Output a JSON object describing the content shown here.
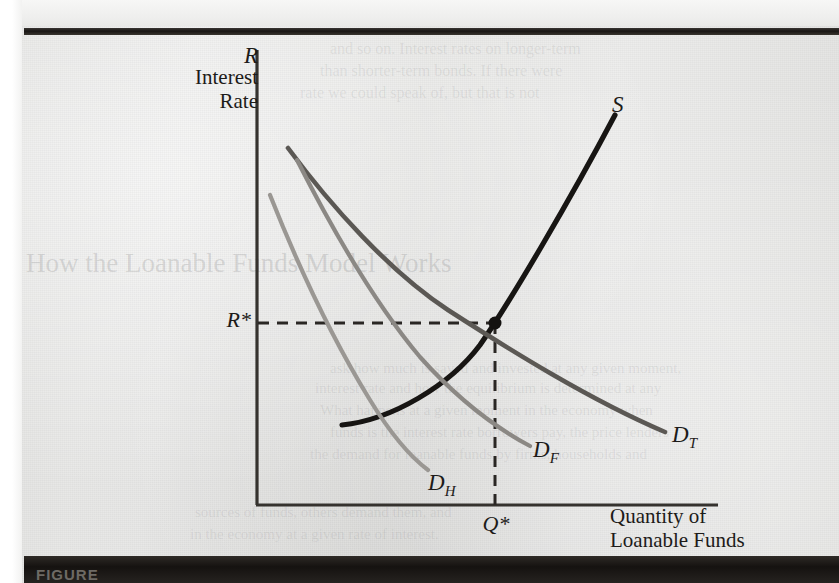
{
  "page": {
    "background_color": "#e8e8e6",
    "caption_prefix": "FIGURE",
    "bleed_through_lines": [
      {
        "text": "the nominal rate — so is very unlikely",
        "x": 95,
        "y": 2,
        "size": 17,
        "class": "ghost"
      },
      {
        "text": "loanable funds have different maturities",
        "x": 24,
        "y": 2,
        "size": 17,
        "class": "ghost faint"
      },
      {
        "text": "and so on. Interest rates on longer-term",
        "x": 330,
        "y": 40,
        "size": 16,
        "class": "ghost faintest"
      },
      {
        "text": "than shorter-term bonds. If there were",
        "x": 320,
        "y": 62,
        "size": 16,
        "class": "ghost faintest"
      },
      {
        "text": "rate we could speak of, but that is not",
        "x": 300,
        "y": 84,
        "size": 16,
        "class": "ghost faintest"
      },
      {
        "text": "How the Loanable Funds Model Works",
        "x": 26,
        "y": 248,
        "size": 27,
        "class": "ghost faint"
      },
      {
        "text": "ask how much is saved and invested at any given moment,",
        "x": 330,
        "y": 360,
        "size": 15,
        "class": "ghost faintest"
      },
      {
        "text": "interest rate and how the equilibrium is determined at any",
        "x": 315,
        "y": 380,
        "size": 15,
        "class": "ghost faintest"
      },
      {
        "text": "What happens at a given moment in the economy when",
        "x": 320,
        "y": 402,
        "size": 15,
        "class": "ghost faintest"
      },
      {
        "text": "funds is the interest rate borrowers pay, the price lenders",
        "x": 330,
        "y": 424,
        "size": 15,
        "class": "ghost faintest"
      },
      {
        "text": "the demand for loanable funds by firms, households and",
        "x": 310,
        "y": 446,
        "size": 15,
        "class": "ghost faintest"
      },
      {
        "text": "sources of funds, others demand them, and",
        "x": 195,
        "y": 504,
        "size": 15,
        "class": "ghost faintest"
      },
      {
        "text": "in the economy at a given rate of interest.",
        "x": 190,
        "y": 526,
        "size": 15,
        "class": "ghost faintest"
      }
    ]
  },
  "chart_data": {
    "type": "line",
    "xlabel": "Quantity of Loanable Funds",
    "ylabel": "Interest Rate",
    "ylabel_symbol": "R",
    "grid": false,
    "legend": "inline-curve-labels",
    "axis": {
      "origin_x": 257,
      "origin_y": 505,
      "x_end": 718,
      "y_top": 50,
      "color": "#35322e"
    },
    "equilibrium": {
      "x": 495,
      "y": 323,
      "price_label": "R*",
      "quantity_label": "Q*",
      "dot_color": "#141210"
    },
    "series": [
      {
        "name": "S",
        "label": "S",
        "role": "supply",
        "color": "#171513",
        "width": 5.2,
        "path": "M 342 425 C 392 420, 450 385, 480 345 C 510 302, 570 200, 615 115",
        "description": "Upward sloping supply of loanable funds"
      },
      {
        "name": "D_T",
        "label_main": "D",
        "label_sub": "T",
        "role": "total-demand",
        "color": "#5b5854",
        "width": 4.6,
        "path": "M 288 148 C 330 205, 390 272, 448 310 C 510 350, 590 400, 665 432",
        "description": "Total demand for loanable funds, passes through equilibrium"
      },
      {
        "name": "D_F",
        "label_main": "D",
        "label_sub": "F",
        "role": "firm-demand",
        "color": "#8b8884",
        "width": 4.2,
        "path": "M 297 160 C 330 225, 372 300, 420 357 C 462 404, 500 430, 530 446",
        "description": "Demand for loanable funds by firms"
      },
      {
        "name": "D_H",
        "label_main": "D",
        "label_sub": "H",
        "role": "household-demand",
        "color": "#9a9793",
        "width": 4.2,
        "path": "M 270 195 C 295 258, 330 335, 370 400 C 392 436, 412 458, 428 470",
        "description": "Demand for loanable funds by households"
      }
    ],
    "guide_lines": [
      {
        "name": "equilibrium-price-line",
        "orientation": "horizontal",
        "from_x": 258,
        "to_x": 495,
        "y": 323,
        "style": "dashed"
      },
      {
        "name": "equilibrium-quantity-line",
        "orientation": "vertical",
        "x": 495,
        "from_y": 323,
        "to_y": 505,
        "style": "dashed"
      }
    ]
  }
}
